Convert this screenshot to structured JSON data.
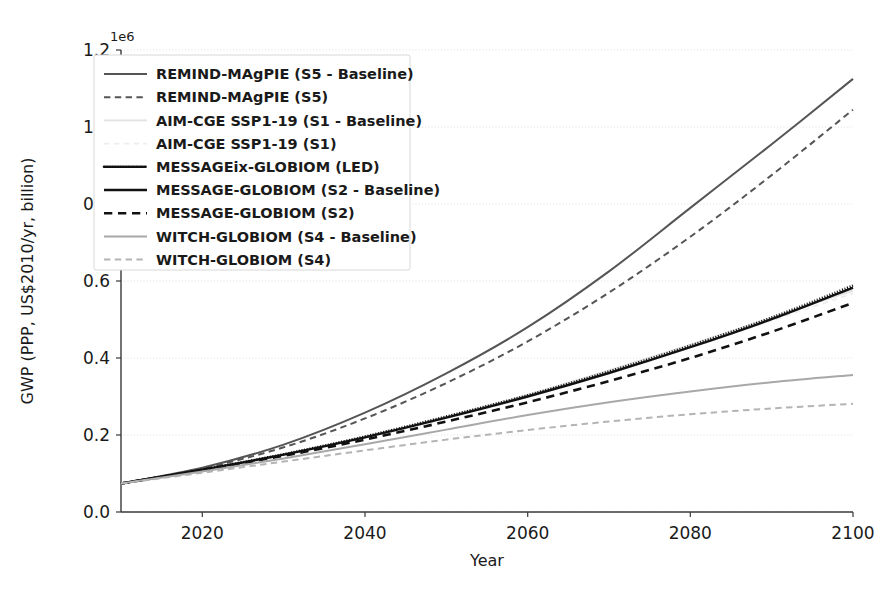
{
  "chart_data": {
    "type": "line",
    "title": "",
    "xlabel": "Year",
    "ylabel": "GWP (PPP, US$2010/yr, billion)",
    "y_offset_text": "1e6",
    "y_offset_multiplier": 1000000,
    "xlim": [
      2010,
      2100
    ],
    "ylim": [
      0.0,
      1.2
    ],
    "xticks": [
      "2020",
      "2040",
      "2060",
      "2080",
      "2100"
    ],
    "xtick_values": [
      2020,
      2040,
      2060,
      2080,
      2100
    ],
    "yticks": [
      "0.0",
      "0.2",
      "0.4",
      "0.6",
      "0.8",
      "1.0",
      "1.2"
    ],
    "ytick_values": [
      0.0,
      0.2,
      0.4,
      0.6,
      0.8,
      1.0,
      1.2
    ],
    "grid": true,
    "legend_position": "upper left",
    "x": [
      2010,
      2020,
      2030,
      2040,
      2050,
      2060,
      2070,
      2080,
      2090,
      2100
    ],
    "series": [
      {
        "name": "REMIND-MAgPIE (S5 - Baseline)",
        "legend_label": "REMIND-MAgPIE (S5 - Baseline)",
        "color": "#555555",
        "style": "solid",
        "width": 2.0,
        "values": [
          0.074,
          0.115,
          0.175,
          0.258,
          0.36,
          0.48,
          0.625,
          0.79,
          0.955,
          1.125
        ]
      },
      {
        "name": "REMIND-MAgPIE (S5)",
        "legend_label": "REMIND-MAgPIE (S5)",
        "color": "#555555",
        "style": "dashed",
        "width": 2.0,
        "values": [
          0.074,
          0.113,
          0.168,
          0.243,
          0.335,
          0.443,
          0.57,
          0.715,
          0.875,
          1.045
        ]
      },
      {
        "name": "AIM-CGE SSP1-19 (S1 - Baseline)",
        "legend_label": "AIM-CGE SSP1-19 (S1 - Baseline)",
        "color": "#e2e2e2",
        "style": "solid",
        "width": 1.8,
        "values": [
          0.074,
          0.108,
          0.15,
          0.196,
          0.248,
          0.305,
          0.368,
          0.435,
          0.505,
          0.575
        ]
      },
      {
        "name": "AIM-CGE SSP1-19 (S1)",
        "legend_label": "AIM-CGE SSP1-19 (S1)",
        "color": "#ededed",
        "style": "dashed",
        "width": 1.8,
        "values": [
          0.074,
          0.107,
          0.147,
          0.192,
          0.243,
          0.298,
          0.36,
          0.427,
          0.497,
          0.568
        ]
      },
      {
        "name": "MESSAGEix-GLOBIOM (LED)",
        "legend_label": "MESSAGEix-GLOBIOM (LED)",
        "color": "#111111",
        "style": "dotted",
        "width": 2.6,
        "values": [
          0.074,
          0.11,
          0.15,
          0.196,
          0.248,
          0.303,
          0.365,
          0.432,
          0.505,
          0.588
        ]
      },
      {
        "name": "MESSAGE-GLOBIOM (S2 - Baseline)",
        "legend_label": "MESSAGE-GLOBIOM (S2 - Baseline)",
        "color": "#111111",
        "style": "solid",
        "width": 2.4,
        "values": [
          0.074,
          0.11,
          0.149,
          0.194,
          0.245,
          0.3,
          0.361,
          0.428,
          0.501,
          0.583
        ]
      },
      {
        "name": "MESSAGE-GLOBIOM (S2)",
        "legend_label": "MESSAGE-GLOBIOM (S2)",
        "color": "#111111",
        "style": "dashed",
        "width": 2.6,
        "values": [
          0.074,
          0.109,
          0.146,
          0.188,
          0.235,
          0.285,
          0.34,
          0.4,
          0.468,
          0.543
        ]
      },
      {
        "name": "WITCH-GLOBIOM (S4 - Baseline)",
        "legend_label": "WITCH-GLOBIOM (S4 - Baseline)",
        "color": "#a8a8a8",
        "style": "solid",
        "width": 2.0,
        "values": [
          0.074,
          0.105,
          0.139,
          0.176,
          0.214,
          0.252,
          0.285,
          0.313,
          0.337,
          0.356
        ]
      },
      {
        "name": "WITCH-GLOBIOM (S4)",
        "legend_label": "WITCH-GLOBIOM (S4)",
        "color": "#b4b4b4",
        "style": "dashed",
        "width": 2.0,
        "values": [
          0.074,
          0.102,
          0.131,
          0.16,
          0.188,
          0.213,
          0.235,
          0.254,
          0.269,
          0.281
        ]
      }
    ]
  }
}
